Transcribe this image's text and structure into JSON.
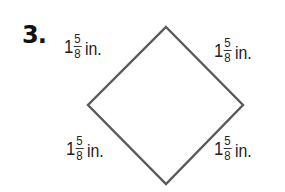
{
  "problem": {
    "number": "3."
  },
  "figure": {
    "shape": "rhombus",
    "stroke_color": "#5a5a5a",
    "vertices": {
      "top": [
        166,
        27
      ],
      "right": [
        243,
        105
      ],
      "bottom": [
        166,
        184
      ],
      "left": [
        88,
        105
      ]
    },
    "side_labels": {
      "top_left": {
        "whole": "1",
        "numerator": "5",
        "denominator": "8",
        "unit": "in."
      },
      "top_right": {
        "whole": "1",
        "numerator": "5",
        "denominator": "8",
        "unit": "in."
      },
      "bottom_left": {
        "whole": "1",
        "numerator": "5",
        "denominator": "8",
        "unit": "in."
      },
      "bottom_right": {
        "whole": "1",
        "numerator": "5",
        "denominator": "8",
        "unit": "in."
      }
    }
  }
}
